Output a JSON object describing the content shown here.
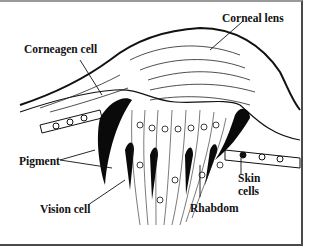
{
  "diagram": {
    "labels": {
      "corneal_lens": "Corneal lens",
      "corneagen_cell": "Corneagen cell",
      "pigment": "Pigment",
      "vision_cell": "Vision cell",
      "rhabdom": "Rhabdom",
      "skin_cells_line1": "Skin",
      "skin_cells_line2": "cells"
    },
    "colors": {
      "ink": "#111111",
      "paper": "#ffffff",
      "frame": "#4a4a4a"
    }
  }
}
